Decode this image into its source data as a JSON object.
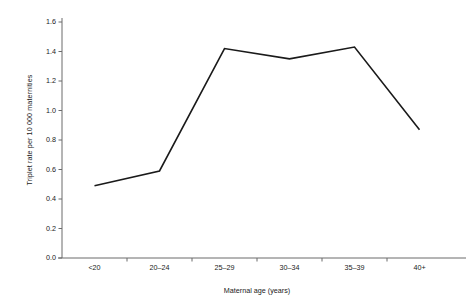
{
  "chart_data": {
    "type": "line",
    "title": "",
    "xlabel": "Maternal age (years)",
    "ylabel": "Triplet rate per 10 000 maternities",
    "categories": [
      "<20",
      "20–24",
      "25–29",
      "30–34",
      "35–39",
      "40+"
    ],
    "values": [
      0.49,
      0.59,
      1.42,
      1.35,
      1.43,
      0.87
    ],
    "series": [
      {
        "name": "Triplet rate",
        "values": [
          0.49,
          0.59,
          1.42,
          1.35,
          1.43,
          0.87
        ]
      }
    ],
    "ylim": [
      0.0,
      1.6
    ],
    "yticks": [
      0.0,
      0.2,
      0.4,
      0.6,
      0.8,
      1.0,
      1.2,
      1.4,
      1.6
    ],
    "ytick_labels": [
      "0.0",
      "0.2",
      "0.4",
      "0.6",
      "0.8",
      "1.0",
      "1.2",
      "1.4",
      "1.6"
    ],
    "grid": false,
    "legend": "none",
    "line_color": "#1a1a1a",
    "axis_color": "#6b6b6b",
    "background_color": "#ffffff",
    "markers": false
  }
}
